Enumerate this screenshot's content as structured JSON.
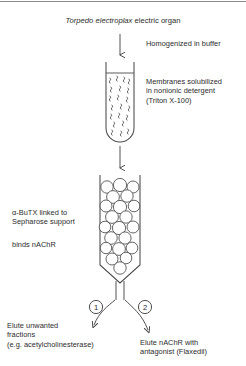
{
  "figure": {
    "title_italic": "Torpedo electroplax",
    "title_roman": " electric organ",
    "title_full": "Torpedo electroplax electric organ",
    "steps": {
      "homogenize": "Homogenized in buffer",
      "solubilize": "Membranes solubilized\nin nonionic detergent\n(Triton X-100)",
      "affinity": "α-BuTX linked to\nSepharose support",
      "binds": "binds nAChR",
      "elute_unwanted": "Elute unwanted\nfractions\n(e.g. acetylcholinesterase)",
      "elute_nachr": "Elute nAChR with\nantagonist (Flaxedil)"
    },
    "markers": {
      "one": "1",
      "two": "2"
    },
    "colors": {
      "ink": "#2b2b2b",
      "line": "#4a4a4a",
      "rule": "#8a8a8a",
      "bead_fill": "#ffffff",
      "background": "#ffffff"
    }
  }
}
